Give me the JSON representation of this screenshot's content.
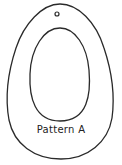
{
  "pattern": {
    "label": "Pattern A",
    "stroke_color": "#2a2a2a",
    "background_color": "#ffffff",
    "parts": [
      "outer-teardrop-outline",
      "inner-oval-cutout",
      "hanging-hole"
    ]
  }
}
